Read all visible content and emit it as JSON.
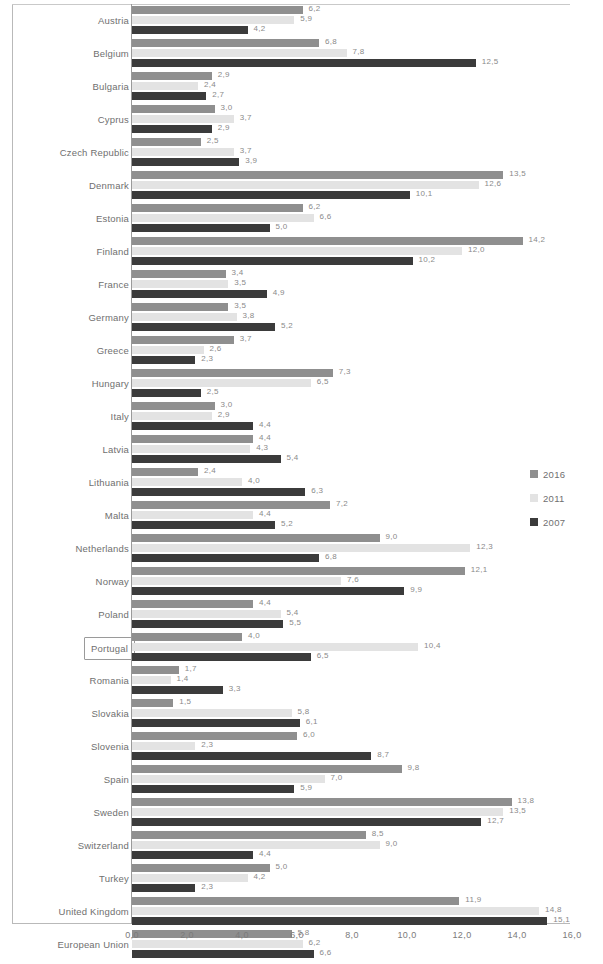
{
  "chart_data": {
    "type": "bar",
    "title": "",
    "subtitle": "",
    "xlabel": "",
    "ylabel": "",
    "orientation": "horizontal",
    "grid": false,
    "legend_position": "right",
    "xlim": [
      0.0,
      16.0
    ],
    "xticks": [
      "0,0",
      "2,0",
      "4,0",
      "6,0",
      "8,0",
      "10,0",
      "12,0",
      "14,0",
      "16,0"
    ],
    "xtick_values": [
      0,
      2,
      4,
      6,
      8,
      10,
      12,
      14,
      16
    ],
    "decimal_separator": ",",
    "highlighted_category": "Portugal",
    "categories": [
      "Austria",
      "Belgium",
      "Bulgaria",
      "Cyprus",
      "Czech Republic",
      "Denmark",
      "Estonia",
      "Finland",
      "France",
      "Germany",
      "Greece",
      "Hungary",
      "Italy",
      "Latvia",
      "Lithuania",
      "Malta",
      "Netherlands",
      "Norway",
      "Poland",
      "Portugal",
      "Romania",
      "Slovakia",
      "Slovenia",
      "Spain",
      "Sweden",
      "Switzerland",
      "Turkey",
      "United Kingdom",
      "European Union"
    ],
    "series": [
      {
        "name": "2016",
        "color": "#8f8f8f",
        "values": [
          6.2,
          6.8,
          2.9,
          3.0,
          2.5,
          13.5,
          6.2,
          14.2,
          3.4,
          3.5,
          3.7,
          7.3,
          3.0,
          4.4,
          2.4,
          7.2,
          9.0,
          12.1,
          4.4,
          4.0,
          1.7,
          1.5,
          6.0,
          9.8,
          13.8,
          8.5,
          5.0,
          11.9,
          5.8
        ],
        "labels": [
          "6,2",
          "6,8",
          "2,9",
          "3,0",
          "2,5",
          "13,5",
          "6,2",
          "14,2",
          "3,4",
          "3,5",
          "3,7",
          "7,3",
          "3,0",
          "4,4",
          "2,4",
          "7,2",
          "9,0",
          "12,1",
          "4,4",
          "4,0",
          "1,7",
          "1,5",
          "6,0",
          "9,8",
          "13,8",
          "8,5",
          "5,0",
          "11,9",
          "5,8"
        ]
      },
      {
        "name": "2011",
        "color": "#e3e3e3",
        "values": [
          5.9,
          7.8,
          2.4,
          3.7,
          3.7,
          12.6,
          6.6,
          12.0,
          3.5,
          3.8,
          2.6,
          6.5,
          2.9,
          4.3,
          4.0,
          4.4,
          12.3,
          7.6,
          5.4,
          10.4,
          1.4,
          5.8,
          2.3,
          7.0,
          13.5,
          9.0,
          4.2,
          14.8,
          6.2
        ],
        "labels": [
          "5,9",
          "7,8",
          "2,4",
          "3,7",
          "3,7",
          "12,6",
          "6,6",
          "12,0",
          "3,5",
          "3,8",
          "2,6",
          "6,5",
          "2,9",
          "4,3",
          "4,0",
          "4,4",
          "12,3",
          "7,6",
          "5,4",
          "10,4",
          "1,4",
          "5,8",
          "2,3",
          "7,0",
          "13,5",
          "9,0",
          "4,2",
          "14,8",
          "6,2"
        ]
      },
      {
        "name": "2007",
        "color": "#3b3b3b",
        "values": [
          4.2,
          12.5,
          2.7,
          2.9,
          3.9,
          10.1,
          5.0,
          10.2,
          4.9,
          5.2,
          2.3,
          2.5,
          4.4,
          5.4,
          6.3,
          5.2,
          6.8,
          9.9,
          5.5,
          6.5,
          3.3,
          6.1,
          8.7,
          5.9,
          12.7,
          4.4,
          2.3,
          15.1,
          6.6
        ],
        "labels": [
          "4,2",
          "12,5",
          "2,7",
          "2,9",
          "3,9",
          "10,1",
          "5,0",
          "10,2",
          "4,9",
          "5,2",
          "2,3",
          "2,5",
          "4,4",
          "5,4",
          "6,3",
          "5,2",
          "6,8",
          "9,9",
          "5,5",
          "6,5",
          "3,3",
          "6,1",
          "8,7",
          "5,9",
          "12,7",
          "4,4",
          "2,3",
          "15,1",
          "6,6"
        ]
      }
    ]
  },
  "legend": {
    "items": [
      {
        "label": "2016",
        "color": "#8f8f8f"
      },
      {
        "label": "2011",
        "color": "#e3e3e3"
      },
      {
        "label": "2007",
        "color": "#3b3b3b"
      }
    ]
  }
}
